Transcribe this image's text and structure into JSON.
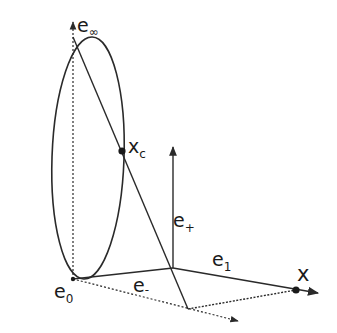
{
  "diagram": {
    "labels": {
      "e_inf": {
        "base": "e",
        "sub": "∞"
      },
      "x_c": {
        "base": "x",
        "sub": "c"
      },
      "e_plus": {
        "base": "e",
        "sub": "+"
      },
      "e_one": {
        "base": "e",
        "sub": "1"
      },
      "e_minus": {
        "base": "e",
        "sub": "-"
      },
      "e_zero": {
        "base": "e",
        "sub": "0"
      },
      "x": {
        "base": "x"
      }
    },
    "colors": {
      "stroke": "#2a2a2a",
      "background": "#ffffff"
    }
  }
}
